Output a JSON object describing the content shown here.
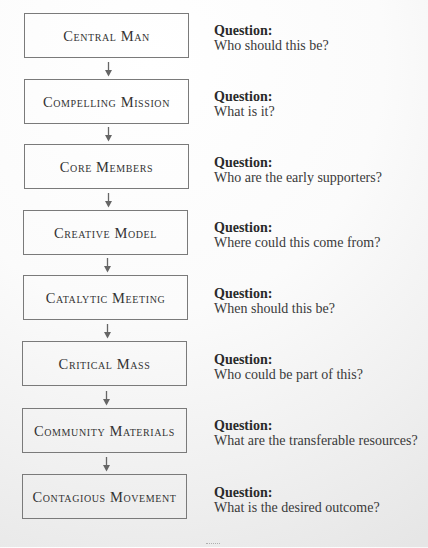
{
  "diagram": {
    "type": "vertical-flowchart",
    "colors": {
      "box_border": "#7a7a7a",
      "arrow": "#666666",
      "text": "#333333"
    },
    "question_heading": "Question:",
    "steps": [
      {
        "label": "Central Man",
        "question": "Who should this be?"
      },
      {
        "label": "Compelling Mission",
        "question": "What is it?"
      },
      {
        "label": "Core Members",
        "question": "Who are the early supporters?"
      },
      {
        "label": "Creative Model",
        "question": "Where could this come from?"
      },
      {
        "label": "Catalytic Meeting",
        "question": "When should this be?"
      },
      {
        "label": "Critical Mass",
        "question": "Who could be part of this?"
      },
      {
        "label": "Community Materials",
        "question": "What are the transferable resources?"
      },
      {
        "label": "Contagious Movement",
        "question": "What is the desired outcome?"
      }
    ],
    "arrow_icon": "down-arrow-icon"
  }
}
